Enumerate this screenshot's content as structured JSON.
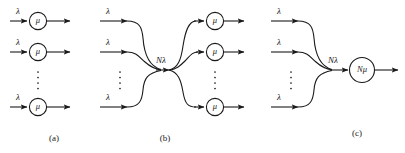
{
  "figure": {
    "background_color": "#ffffff",
    "line_color": "#1a1a1a",
    "width": 405,
    "height": 153
  },
  "symbols": {
    "arrival_rate": "λ",
    "service_rate": "μ",
    "aggregate_arrival_rate": "Nλ",
    "aggregate_service_rate": "Nμ",
    "vertical_ellipsis": "⋮"
  },
  "panels": [
    {
      "id": "a",
      "caption": "(a)",
      "description": "N independent single-server queues",
      "rows": [
        {
          "input_label": "λ",
          "server_label": "μ",
          "y": 21
        },
        {
          "input_label": "λ",
          "server_label": "μ",
          "y": 52
        },
        {
          "input_label": "λ",
          "server_label": "μ",
          "y": 107
        }
      ],
      "ellipsis": {
        "x": 38,
        "y": 80,
        "label": "⋮"
      },
      "caption_pos": {
        "x": 54,
        "y": 139
      }
    },
    {
      "id": "b",
      "caption": "(b)",
      "description": "Pooled arrivals split across N servers",
      "merge_label": "Nλ",
      "merge_label_pos": {
        "x": 161,
        "y": 61
      },
      "merge_point": {
        "x": 163,
        "y": 70
      },
      "input_rows": [
        {
          "input_label": "λ",
          "y": 21
        },
        {
          "input_label": "λ",
          "y": 52
        },
        {
          "input_label": "λ",
          "y": 107
        }
      ],
      "input_ellipsis": {
        "x": 120,
        "y": 80,
        "label": "⋮"
      },
      "output_rows": [
        {
          "server_label": "μ",
          "y": 21
        },
        {
          "server_label": "μ",
          "y": 52
        },
        {
          "server_label": "μ",
          "y": 107
        }
      ],
      "output_ellipsis": {
        "x": 215,
        "y": 80,
        "label": "⋮"
      },
      "caption_pos": {
        "x": 165,
        "y": 139
      }
    },
    {
      "id": "c",
      "caption": "(c)",
      "description": "Pooled arrivals served by one fast server",
      "merge_label": "Nλ",
      "merge_label_pos": {
        "x": 332,
        "y": 61
      },
      "merge_point": {
        "x": 334,
        "y": 70
      },
      "input_rows": [
        {
          "input_label": "λ",
          "y": 21
        },
        {
          "input_label": "λ",
          "y": 52
        },
        {
          "input_label": "λ",
          "y": 107
        }
      ],
      "input_ellipsis": {
        "x": 291,
        "y": 80,
        "label": "⋮"
      },
      "server": {
        "label": "Nμ",
        "x": 362,
        "y": 70,
        "radius": 12.5
      },
      "caption_pos": {
        "x": 357,
        "y": 134
      }
    }
  ]
}
